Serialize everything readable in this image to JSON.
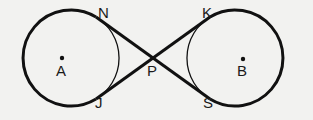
{
  "diagram": {
    "type": "geometry",
    "circles": [
      {
        "name": "A",
        "center_label": "A"
      },
      {
        "name": "B",
        "center_label": "B"
      }
    ],
    "points": {
      "N": "N",
      "J": "J",
      "K": "K",
      "S": "S",
      "P": "P",
      "A": "A",
      "B": "B"
    },
    "segments": [
      "NP",
      "PS",
      "KP",
      "PJ"
    ]
  }
}
